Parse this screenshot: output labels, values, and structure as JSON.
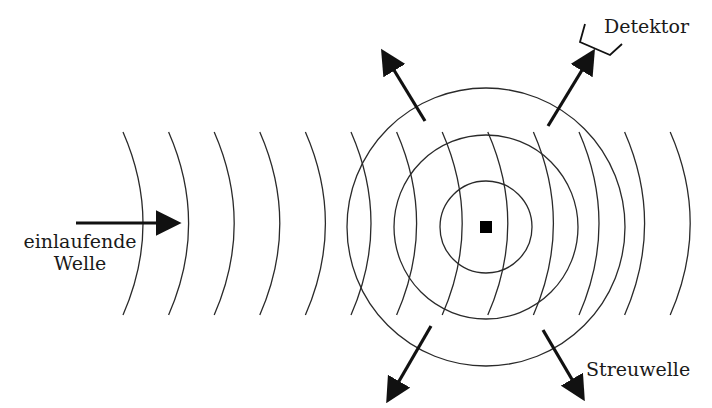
{
  "diagram": {
    "labels": {
      "detector": "Detektor",
      "incoming_line1": "einlaufende",
      "incoming_line2": "Welle",
      "scattered": "Streuwelle"
    },
    "colors": {
      "stroke": "#2a2a2a",
      "arrow": "#111111",
      "scatterer": "#000000",
      "background": "#ffffff"
    },
    "scatterer": {
      "cx": 486,
      "cy": 227,
      "size": 12
    },
    "scattered_wave_circles": [
      {
        "r": 46
      },
      {
        "r": 92
      },
      {
        "r": 139
      }
    ],
    "incoming_wavefronts": {
      "count": 13,
      "first_top_x": 123,
      "spacing": 45.6,
      "bulge": 20,
      "y_top": 132,
      "y_bottom": 315
    },
    "arrows": [
      {
        "name": "incoming",
        "x1": 76,
        "y1": 223,
        "x2": 172,
        "y2": 223
      },
      {
        "name": "scatter-upper-left",
        "x1": 425,
        "y1": 121,
        "x2": 386,
        "y2": 57
      },
      {
        "name": "scatter-upper-right",
        "x1": 548,
        "y1": 126,
        "x2": 590,
        "y2": 57
      },
      {
        "name": "scatter-lower-left",
        "x1": 431,
        "y1": 326,
        "x2": 391,
        "y2": 395
      },
      {
        "name": "scatter-lower-right",
        "x1": 543,
        "y1": 330,
        "x2": 580,
        "y2": 393
      }
    ],
    "detector_glyph": [
      [
        585,
        24
      ],
      [
        580,
        42
      ],
      [
        610,
        55
      ],
      [
        622,
        44
      ]
    ]
  }
}
